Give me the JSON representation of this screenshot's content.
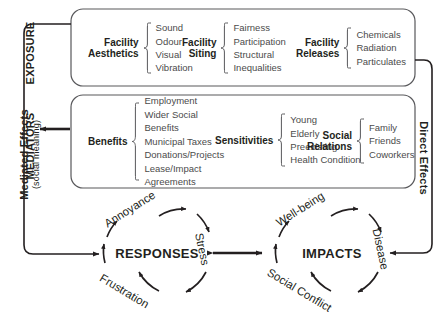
{
  "figure": {
    "side_labels": {
      "exposure": "EXPOSURE",
      "mediators": "MEDIATORS",
      "mediated_effects": "Mediated Effects",
      "mediated_effects_sub": "(social meaning)",
      "direct_effects": "Direct Effects"
    },
    "exposure_groups": [
      {
        "head": "Facility\nAesthetics",
        "items": "Sound\nOdour\nVisual\nVibration"
      },
      {
        "head": "Facility\nSiting",
        "items": "Fairness\nParticipation\nStructural\nInequalities"
      },
      {
        "head": "Facility\nReleases",
        "items": "Chemicals\nRadiation\nParticulates"
      }
    ],
    "mediator_groups": [
      {
        "head": "Benefits",
        "items": "Employment\nWider Social\nBenefits\nMunicipal Taxes\nDonations/Projects\nLease/Impact\nAgreements"
      },
      {
        "head": "Sensitivities",
        "items": "Young\nElderly\nPreexisting\nHealth Condition"
      },
      {
        "head": "Social\nRelations",
        "items": "Family\nFriends\nCoworkers"
      }
    ],
    "outcome_circles": [
      {
        "core": "RESPONSES",
        "orbit": [
          {
            "label": "Annoyance"
          },
          {
            "label": "Stress"
          },
          {
            "label": "Frustration"
          }
        ]
      },
      {
        "core": "IMPACTS",
        "orbit": [
          {
            "label": "Well-being"
          },
          {
            "label": "Disease"
          },
          {
            "label": "Social Conflict"
          }
        ]
      }
    ],
    "colors": {
      "ink": "#231f20",
      "list_text": "#4b4b4b",
      "box_stroke": "#58585b",
      "connector": "#231f20"
    }
  }
}
